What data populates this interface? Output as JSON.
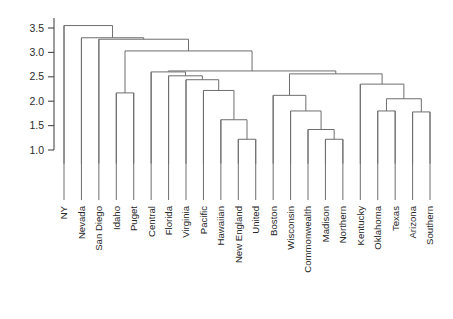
{
  "chart_data": {
    "type": "dendrogram",
    "title": "",
    "xlabel": "",
    "ylabel": "",
    "ylim": [
      0.72,
      3.62
    ],
    "grid": false,
    "legend": null,
    "axis_ticks": [
      "1.0",
      "1.5",
      "2.0",
      "2.5",
      "3.0",
      "3.5"
    ],
    "axis_tick_values": [
      1.0,
      1.5,
      2.0,
      2.5,
      3.0,
      3.5
    ],
    "leaf_labels": [
      "NY",
      "Nevada",
      "San Diego",
      "Idaho",
      "Puget",
      "Central",
      "Florida",
      "Virginia",
      "Pacific",
      "Hawaiian",
      "New England",
      "United",
      "Boston",
      "Wisconsin",
      "Commonwealth",
      "Madison",
      "Northern",
      "Kentucky",
      "Oklahoma",
      "Texas",
      "Arizona",
      "Southern"
    ],
    "leaf_count": 22,
    "leaf_baseline": 0.72,
    "merges": [
      {
        "id": "m1",
        "left": "New England",
        "right": "United",
        "height": 1.22
      },
      {
        "id": "m2",
        "left": "Madison",
        "right": "Northern",
        "height": 1.22
      },
      {
        "id": "m3",
        "left": "Commonwealth",
        "right": "m2",
        "height": 1.42
      },
      {
        "id": "m4",
        "left": "Hawaiian",
        "right": "m1",
        "height": 1.62
      },
      {
        "id": "m5",
        "left": "Oklahoma",
        "right": "Texas",
        "height": 1.8
      },
      {
        "id": "m6",
        "left": "Arizona",
        "right": "Southern",
        "height": 1.78
      },
      {
        "id": "m7",
        "left": "Wisconsin",
        "right": "m3",
        "height": 1.8
      },
      {
        "id": "m8",
        "left": "m5",
        "right": "m6",
        "height": 2.05
      },
      {
        "id": "m9",
        "left": "Boston",
        "right": "m7",
        "height": 2.12
      },
      {
        "id": "m10",
        "left": "Pacific",
        "right": "m4",
        "height": 2.22
      },
      {
        "id": "m11",
        "left": "Kentucky",
        "right": "m8",
        "height": 2.35
      },
      {
        "id": "m12",
        "left": "Virginia",
        "right": "m10",
        "height": 2.44
      },
      {
        "id": "m13",
        "left": "Idaho",
        "right": "Puget",
        "height": 2.17
      },
      {
        "id": "m14",
        "left": "Florida",
        "right": "m12",
        "height": 2.52
      },
      {
        "id": "m15",
        "left": "m9",
        "right": "m11",
        "height": 2.56
      },
      {
        "id": "m16",
        "left": "Central",
        "right": "m14",
        "height": 2.6
      },
      {
        "id": "m17",
        "left": "m16",
        "right": "m15",
        "height": 2.62
      },
      {
        "id": "m18",
        "left": "m13",
        "right": "m17",
        "height": 3.03
      },
      {
        "id": "m19",
        "left": "San Diego",
        "right": "m18",
        "height": 3.27
      },
      {
        "id": "m20",
        "left": "Nevada",
        "right": "m19",
        "height": 3.3
      },
      {
        "id": "m21",
        "left": "NY",
        "right": "m20",
        "height": 3.55
      }
    ]
  },
  "colors": {
    "link": "#6e6e6e",
    "axis": "#4a4a4a",
    "tick_text": "#2b2b2b",
    "leaf_text": "#272727",
    "background": "#ffffff"
  },
  "header": {
    "faint_text": ""
  }
}
